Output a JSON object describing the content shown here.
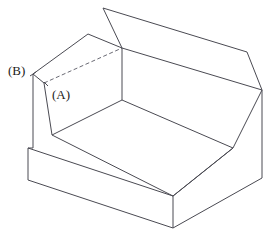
{
  "figure": {
    "projection": "isometric",
    "background_color": "#ffffff",
    "line_color": "#4a4a52",
    "hidden_line_color": "#6a6a74",
    "line_width_px": 1,
    "hidden_line_dash": "4 2.5"
  },
  "labels": {
    "a": "(A)",
    "b": "(B)",
    "a_target": "front face of left wall below slot",
    "b_target": "top front vertex of left wall"
  },
  "geometry": {
    "units": "px",
    "viewbox": "0 0 278 241",
    "vertices": {
      "back_top_far_left": "103,8",
      "back_top_far_right": "247,52",
      "back_top_near_right": "262,90",
      "back_top_near_left": "122,48",
      "slot_inner_left": "33,74",
      "slot_top_left": "88,34",
      "left_top_front": "33,74",
      "left_bottom_front": "28,148",
      "inner_floor_left": "52,135",
      "inner_floor_front": "173,196",
      "inner_floor_right": "233,148",
      "inner_back_left": "122,100",
      "base_front": "173,228",
      "base_right": "262,178",
      "right_bottom": "262,90"
    },
    "outline_path": "M 33 74 L 88 34 L 103 8 L 247 52 L 262 90 L 262 178 L 173 228 L 28 148 L 28 148 Z",
    "hidden_edge": "M 43 83 L 122 48"
  },
  "faces": [
    {
      "name": "top-back-wall-upper-face",
      "role": "top surface of rear wall"
    },
    {
      "name": "left-wall-slot-ledge",
      "role": "narrow ledge / slot on left wall top"
    },
    {
      "name": "left-wall-front-face",
      "role": "front face labelled (A)"
    },
    {
      "name": "channel-floor",
      "role": "inner bottom of U channel"
    },
    {
      "name": "inner-back-wall",
      "role": "inner vertical face of rear wall"
    },
    {
      "name": "base-front-face",
      "role": "front face of base slab"
    },
    {
      "name": "right-end-face",
      "role": "right end face of block"
    }
  ]
}
